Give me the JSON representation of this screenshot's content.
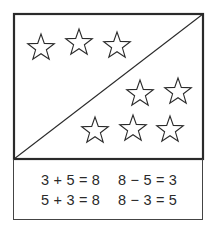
{
  "figure": {
    "stroke_color": "#2a2a2a",
    "background": "#ffffff",
    "panel": {
      "upper_left_region": {
        "star_count": 3
      },
      "lower_right_region": {
        "star_count": 5
      },
      "total_stars": 8
    }
  },
  "equations": {
    "addition": [
      "3 + 5 = 8",
      "5 + 3 = 8"
    ],
    "subtraction": [
      "8 − 5 = 3",
      "8 − 3 = 5"
    ]
  }
}
